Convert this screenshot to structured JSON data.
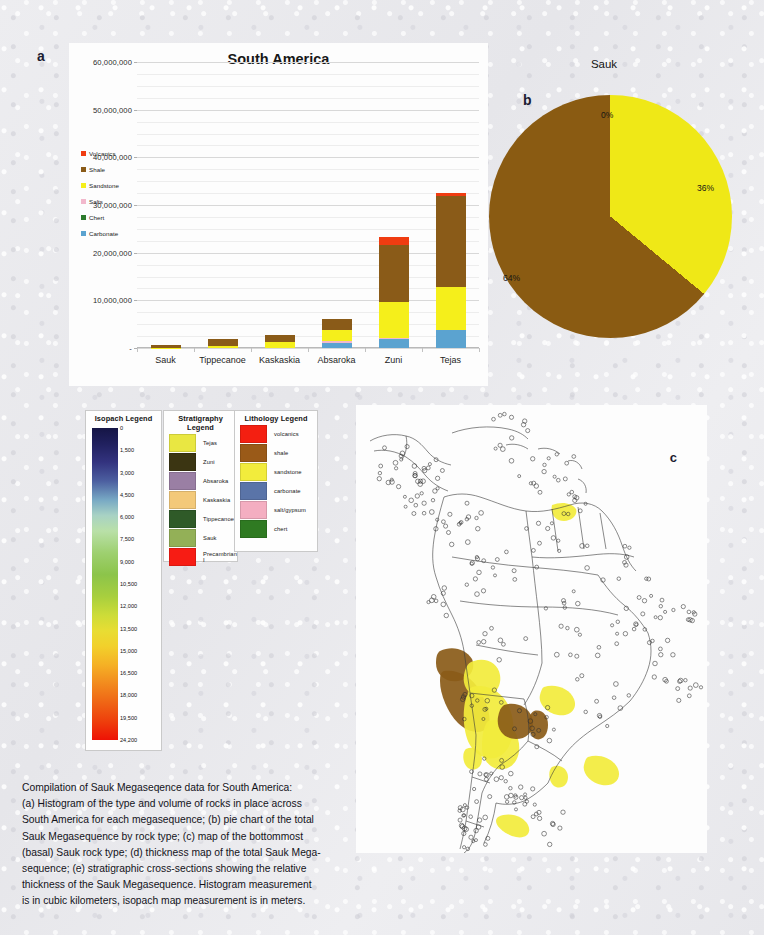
{
  "panels": {
    "a_label": "a",
    "b_label": "b",
    "c_label": "c"
  },
  "chart_data": [
    {
      "type": "bar",
      "id": "histogram",
      "title": "South America",
      "xlabel": "",
      "ylabel": "",
      "ylim": [
        0,
        60000000
      ],
      "ytick_values": [
        0,
        10000000,
        20000000,
        30000000,
        40000000,
        50000000,
        60000000
      ],
      "ytick_labels": [
        "-",
        "10,000,000",
        "20,000,000",
        "30,000,000",
        "40,000,000",
        "50,000,000",
        "60,000,000"
      ],
      "grid": true,
      "stacked": true,
      "legend_position": "inside-upper-left",
      "categories": [
        "Sauk",
        "Tippecanoe",
        "Kaskaskia",
        "Absaroka",
        "Zuni",
        "Tejas"
      ],
      "series": [
        {
          "name": "Carbonate",
          "color": "#5ba3d0",
          "values": [
            0,
            0,
            0,
            1000000,
            1900000,
            3700000
          ]
        },
        {
          "name": "Chert",
          "color": "#2c7a2c",
          "values": [
            0,
            0,
            0,
            0,
            0,
            0
          ]
        },
        {
          "name": "Salts",
          "color": "#f2b8cc",
          "values": [
            0,
            0,
            0,
            500000,
            300000,
            0
          ]
        },
        {
          "name": "Sandstone",
          "color": "#f5ef1b",
          "values": [
            100000,
            400000,
            1300000,
            2300000,
            7500000,
            9100000
          ]
        },
        {
          "name": "Shale",
          "color": "#8a5b18",
          "values": [
            600000,
            1400000,
            1400000,
            2300000,
            12000000,
            19000000
          ]
        },
        {
          "name": "Volcanics",
          "color": "#f03c11",
          "values": [
            0,
            0,
            0,
            0,
            1600000,
            800000
          ]
        }
      ]
    },
    {
      "type": "pie",
      "id": "sauk-pie",
      "title": "Sauk",
      "labels": [
        "0%",
        "36%",
        "64%"
      ],
      "slices": [
        {
          "name": "sandstone",
          "percent": 36,
          "label": "36%",
          "color": "#efe817"
        },
        {
          "name": "shale",
          "percent": 64,
          "label": "64%",
          "color": "#8a5b12"
        }
      ],
      "zero_label": "0%"
    }
  ],
  "isopach_legend": {
    "title": "Isopach Legend",
    "ticks": [
      "0",
      "1,500",
      "3,000",
      "4,500",
      "6,000",
      "7,500",
      "9,000",
      "10,500",
      "12,000",
      "13,500",
      "15,000",
      "16,500",
      "18,000",
      "19,500",
      "24,200"
    ]
  },
  "stratigraphy_legend": {
    "title": "Stratigraphy Legend",
    "items": [
      {
        "label": "Tejas",
        "color": "#e9e742"
      },
      {
        "label": "Zuni",
        "color": "#3b3512"
      },
      {
        "label": "Absaroka",
        "color": "#9a7fa4"
      },
      {
        "label": "Kaskaskia",
        "color": "#f3c979"
      },
      {
        "label": "Tippecanoe",
        "color": "#2f5a28"
      },
      {
        "label": "Sauk",
        "color": "#93b057"
      },
      {
        "label": "Precambrian I",
        "color": "#f71c14"
      }
    ]
  },
  "lithology_legend": {
    "title": "Lithology Legend",
    "items": [
      {
        "label": "volcanics",
        "color": "#f41f11"
      },
      {
        "label": "shale",
        "color": "#9a5a18"
      },
      {
        "label": "sandstone",
        "color": "#f2ec3c"
      },
      {
        "label": "carbonate",
        "color": "#5a74a8"
      },
      {
        "label": "salt/gypsum",
        "color": "#f4aec1"
      },
      {
        "label": "chert",
        "color": "#2f7a22"
      }
    ]
  },
  "map": {
    "region": "South America",
    "marker_name": "well-location-marker",
    "shading": [
      {
        "name": "sandstone-area",
        "color": "#f2ec3c"
      },
      {
        "name": "shale-area",
        "color": "#8a5b18"
      }
    ]
  },
  "caption": {
    "lines": [
      "Compilation of Sauk Megaseqence data for South America:",
      "(a) Histogram of the type and volume of rocks in place across",
      "South America for each megasequence; (b) pie chart of the total",
      "Sauk Megasequence by rock type; (c) map of the bottommost",
      "(basal) Sauk rock type; (d) thickness map of the total Sauk Mega-",
      "sequence; (e) stratigraphic cross-sections showing the relative",
      "thickness of the Sauk Megasequence. Histogram measurement",
      "is in cubic kilometers, isopach map measurement is in meters."
    ]
  }
}
